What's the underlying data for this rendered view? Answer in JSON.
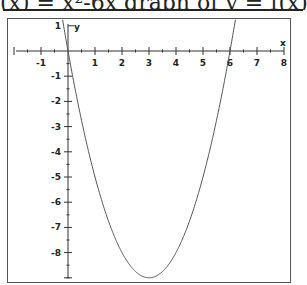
{
  "header": {
    "partial_text": "(x) = x²-6x  graph of y = f(x)"
  },
  "chart_data": {
    "type": "line",
    "title": "",
    "xlabel": "x",
    "ylabel": "y",
    "function": "y = x^2 - 6x",
    "xlim": [
      -2,
      8.2
    ],
    "ylim": [
      -9,
      1
    ],
    "x_ticks": [
      -1,
      1,
      2,
      3,
      4,
      5,
      6,
      7,
      8
    ],
    "y_ticks": [
      1,
      -1,
      -2,
      -3,
      -4,
      -5,
      -6,
      -7,
      -8
    ],
    "x_tick_labels": [
      "-1",
      "1",
      "2",
      "3",
      "4",
      "5",
      "6",
      "7",
      "8"
    ],
    "y_tick_labels": [
      "1",
      "-1",
      "-2",
      "-3",
      "-4",
      "-5",
      "-6",
      "-7",
      "-8"
    ],
    "grid": false,
    "series": [
      {
        "name": "parabola",
        "x": [
          -0.15,
          0,
          0.5,
          1,
          1.5,
          2,
          2.5,
          3,
          3.5,
          4,
          4.5,
          5,
          5.5,
          6,
          6.15
        ],
        "values": [
          0.92,
          0,
          -2.75,
          -5,
          -6.75,
          -8,
          -8.75,
          -9,
          -8.75,
          -8,
          -6.75,
          -5,
          -2.75,
          0,
          0.92
        ]
      }
    ],
    "annotations": {
      "vertex": [
        3,
        -9
      ],
      "roots": [
        0,
        6
      ]
    },
    "colors": {
      "curve": "#555555",
      "axes": "#333333",
      "frame": "#555555"
    }
  }
}
